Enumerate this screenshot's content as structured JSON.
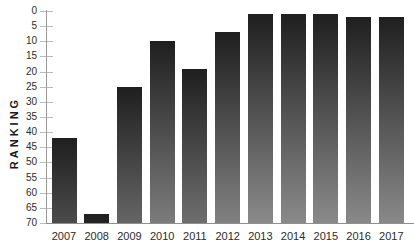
{
  "chart_data": {
    "type": "bar",
    "title": "",
    "ylabel": "RANKING",
    "xlabel": "",
    "categories": [
      "2007",
      "2008",
      "2009",
      "2010",
      "2011",
      "2012",
      "2013",
      "2014",
      "2015",
      "2016",
      "2017"
    ],
    "values": [
      42,
      67,
      25,
      10,
      19,
      7,
      1,
      1,
      1,
      2,
      2
    ],
    "y_ticks": [
      0,
      5,
      10,
      15,
      20,
      25,
      30,
      35,
      40,
      45,
      50,
      55,
      60,
      65,
      70
    ],
    "ylim": [
      0,
      70
    ],
    "y_axis_inverted": true,
    "grid": false,
    "legend": "none",
    "colors": {
      "bar_top": "#1f1f1f",
      "bar_bottom": "#8c8c8c",
      "axis": "#999999",
      "tick": "#bcbcbc",
      "text": "#2b2b2b",
      "background": "#ffffff"
    }
  }
}
